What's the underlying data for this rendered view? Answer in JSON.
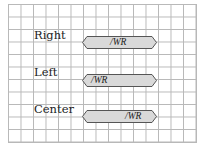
{
  "rows": [
    {
      "label": "Right",
      "text": "/WR",
      "align": "right-demo"
    },
    {
      "label": "Left",
      "text": "/WR",
      "align": "left"
    },
    {
      "label": "Center",
      "text": "/WR",
      "align": "center-demo"
    }
  ],
  "colors": {
    "shape_fill": "#d9d9d9",
    "shape_stroke": "#555555",
    "grid": "#b8b8b8"
  }
}
